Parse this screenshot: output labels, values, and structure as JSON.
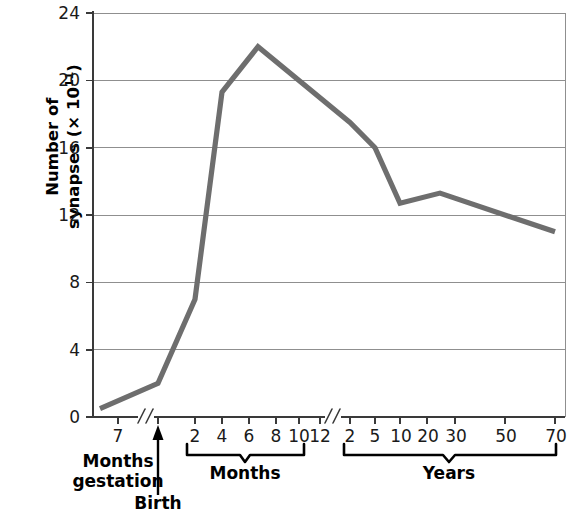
{
  "chart_data": {
    "type": "line",
    "title": "",
    "subtitle": "",
    "xlabel": "",
    "ylabel": "Number of synapses (× 10¹¹)",
    "ylabel_line1": "Number of",
    "ylabel_line2_prefix": "synapses (× 10",
    "ylabel_line2_exponent": "11",
    "ylabel_line2_suffix": ")",
    "ylim": [
      0,
      24
    ],
    "yticks": [
      0,
      4,
      8,
      12,
      16,
      20,
      24
    ],
    "ytick_labels": [
      "0",
      "4",
      "8",
      "12",
      "16",
      "20",
      "24"
    ],
    "grid": "horizontal",
    "legend": "none",
    "line_color": "#6e6e6e",
    "axis_color": "#3a3a3a",
    "grid_color": "#8f8f8f",
    "axis_breaks": 2,
    "x_segments": [
      {
        "name": "gestation",
        "group_label": "Months gestation",
        "group_label_line1": "Months",
        "group_label_line2": "gestation",
        "tick_labels": [
          "7"
        ],
        "unit": "months gestation"
      },
      {
        "name": "months",
        "group_label": "Months",
        "tick_labels": [
          "2",
          "4",
          "6",
          "8",
          "10",
          "12"
        ],
        "unit": "months after birth"
      },
      {
        "name": "years",
        "group_label": "Years",
        "tick_labels": [
          "2",
          "5",
          "10",
          "20",
          "30",
          "50",
          "70"
        ],
        "unit": "years"
      }
    ],
    "annotations": [
      {
        "name": "birth-marker",
        "label": "Birth",
        "type": "arrow-up"
      }
    ],
    "points": [
      {
        "x_label": "7 months gestation",
        "y": 0.5
      },
      {
        "x_label": "Birth",
        "y": 2.0
      },
      {
        "x_label": "2 months",
        "y": 7.0
      },
      {
        "x_label": "4 months",
        "y": 19.3
      },
      {
        "x_label": "8 months",
        "y": 22.0
      },
      {
        "x_label": "2 years",
        "y": 17.5
      },
      {
        "x_label": "5 years",
        "y": 16.0
      },
      {
        "x_label": "10 years",
        "y": 12.7
      },
      {
        "x_label": "30 years",
        "y": 13.3
      },
      {
        "x_label": "70 years",
        "y": 11.0
      }
    ],
    "values": [
      0.5,
      2.0,
      7.0,
      19.3,
      22.0,
      17.5,
      16.0,
      12.7,
      13.3,
      11.0
    ],
    "categories": [
      "7 months gestation",
      "Birth",
      "2 months",
      "4 months",
      "8 months",
      "2 years",
      "5 years",
      "10 years",
      "30 years",
      "70 years"
    ]
  },
  "axis_titles": {
    "gestation_label_line1": "Months",
    "gestation_label_line2": "gestation",
    "months_label": "Months",
    "years_label": "Years",
    "birth_label": "Birth"
  }
}
